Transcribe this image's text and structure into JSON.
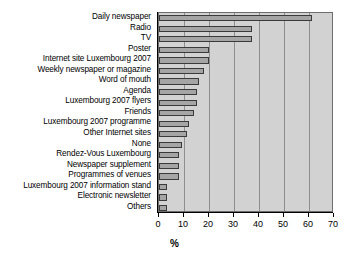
{
  "chart_data": {
    "type": "bar",
    "orientation": "horizontal",
    "title": "",
    "xlabel": "%",
    "ylabel": "",
    "xlim": [
      0,
      70
    ],
    "xticks": [
      0,
      10,
      20,
      30,
      40,
      50,
      60,
      70
    ],
    "grid": true,
    "legend": false,
    "bar_color": "#a5a5a5",
    "bar_edge_color": "#3a3a3a",
    "plot_background": "#d2d2d2",
    "categories": [
      "Daily newspaper",
      "Radio",
      "TV",
      "Poster",
      "Internet site Luxembourg 2007",
      "Weekly newspaper or magazine",
      "Word of mouth",
      "Agenda",
      "Luxembourg 2007 flyers",
      "Friends",
      "Luxembourg 2007 programme",
      "Other Internet sites",
      "None",
      "Rendez-Vous Luxembourg",
      "Newspaper supplement",
      "Programmes of venues",
      "Luxembourg 2007 information stand",
      "Electronic newsletter",
      "Others"
    ],
    "values": [
      61,
      37,
      37,
      20,
      20,
      18,
      16,
      15,
      15,
      14,
      12,
      11,
      9,
      8,
      8,
      8,
      3,
      3,
      3
    ]
  }
}
